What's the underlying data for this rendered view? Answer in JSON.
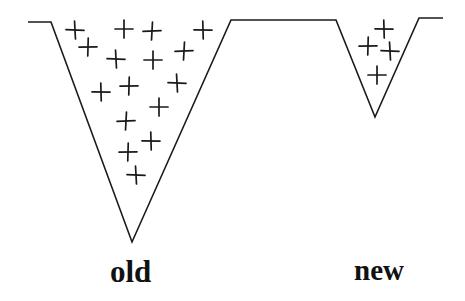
{
  "diagram": {
    "line_color": "#1a1a1a",
    "background": "#ffffff",
    "profile_points": [
      [
        28,
        22
      ],
      [
        51,
        22
      ],
      [
        132,
        242
      ],
      [
        231,
        20
      ],
      [
        336,
        20
      ],
      [
        375,
        117
      ],
      [
        419,
        18
      ],
      [
        443,
        18
      ]
    ],
    "groups": [
      {
        "name": "old",
        "label": "old",
        "plus_count": 19,
        "plus_positions": [
          [
            75,
            30
          ],
          [
            124,
            29
          ],
          [
            152,
            31
          ],
          [
            203,
            30
          ],
          [
            88,
            47
          ],
          [
            116,
            59
          ],
          [
            153,
            60
          ],
          [
            184,
            51
          ],
          [
            101,
            92
          ],
          [
            129,
            86
          ],
          [
            177,
            83
          ],
          [
            159,
            107
          ],
          [
            126,
            121
          ],
          [
            151,
            141
          ],
          [
            128,
            152
          ],
          [
            136,
            175
          ],
          [
            104,
            94
          ],
          [
            130,
            150
          ],
          [
            156,
            108
          ]
        ]
      },
      {
        "name": "new",
        "label": "new",
        "plus_count": 4,
        "plus_positions": [
          [
            384,
            29
          ],
          [
            368,
            46
          ],
          [
            390,
            51
          ],
          [
            377,
            75
          ]
        ]
      }
    ]
  }
}
